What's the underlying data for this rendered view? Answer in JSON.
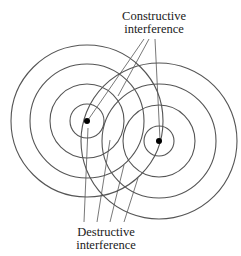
{
  "labels": {
    "constructive": [
      "Constructive",
      "interference"
    ],
    "destructive": [
      "Destructive",
      "interference"
    ]
  },
  "sources": [
    {
      "cx": 87,
      "cy": 121,
      "radii": [
        17,
        37,
        57,
        76
      ]
    },
    {
      "cx": 159,
      "cy": 141,
      "radii": [
        15,
        36,
        57,
        78
      ]
    }
  ],
  "colors": {
    "stroke": "#555555",
    "dot": "#000000",
    "text": "#1a1a1a"
  }
}
